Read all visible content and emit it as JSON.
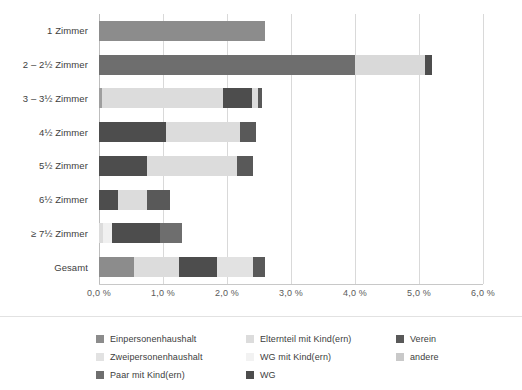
{
  "chart_data": {
    "type": "bar",
    "orientation": "horizontal",
    "stacked": true,
    "title": "",
    "subtitle": "",
    "xlabel": "",
    "ylabel": "",
    "xlim": [
      0.0,
      6.0
    ],
    "grid": true,
    "legend_position": "bottom",
    "xticks": [
      0.0,
      1.0,
      2.0,
      3.0,
      4.0,
      5.0,
      6.0
    ],
    "xtick_labels": [
      "0,0 %",
      "1,0 %",
      "2,0 %",
      "3,0 %",
      "4,0 %",
      "5,0 %",
      "6,0 %"
    ],
    "categories": [
      "1 Zimmer",
      "2 – 2½ Zimmer",
      "3 – 3½ Zimmer",
      "4½ Zimmer",
      "5½ Zimmer",
      "6½ Zimmer",
      "≥ 7½ Zimmer",
      "Gesamt"
    ],
    "series": [
      {
        "name": "Einpersonenhaushalt",
        "color": "#8c8c8c",
        "values": [
          2.6,
          0.0,
          0.0,
          0.0,
          0.0,
          0.0,
          0.0,
          0.55
        ]
      },
      {
        "name": "Zweipersonenhaushalt",
        "color": "#d5d5d5",
        "values": [
          0.0,
          0.0,
          0.0,
          0.0,
          0.0,
          0.0,
          0.07,
          0.7
        ]
      },
      {
        "name": "Paar mit Kind(ern)",
        "color": "#6e6e6e",
        "values": [
          0.0,
          4.0,
          0.0,
          0.0,
          0.0,
          0.0,
          0.0,
          0.0
        ]
      },
      {
        "name": "Elternteil mit Kind(ern)",
        "color": "#d9d9d9",
        "values": [
          0.0,
          1.1,
          0.05,
          0.0,
          0.0,
          0.0,
          0.0,
          0.0
        ]
      },
      {
        "name": "WG mit Kind(ern)",
        "color": "#ededed",
        "values": [
          0.0,
          0.0,
          1.88,
          0.0,
          0.0,
          0.0,
          0.0,
          0.0
        ]
      },
      {
        "name": "WG",
        "color": "#4d4d4d",
        "values": [
          0.0,
          0.1,
          0.46,
          1.05,
          0.75,
          0.3,
          0.75,
          0.6
        ]
      },
      {
        "name": "Verein",
        "color": "#595959",
        "values": [
          0.0,
          0.0,
          0.06,
          0.25,
          0.25,
          0.36,
          0.35,
          0.2
        ]
      },
      {
        "name": "andere",
        "color": "#c9c9c9",
        "values": [
          0.0,
          0.0,
          0.1,
          1.15,
          1.4,
          0.45,
          0.13,
          0.55
        ]
      }
    ],
    "bars": [
      {
        "category": "1 Zimmer",
        "total": 2.6,
        "segments": [
          {
            "series": "Einpersonenhaushalt",
            "start": 0.0,
            "value": 2.6,
            "color": "#8c8c8c"
          }
        ]
      },
      {
        "category": "2 – 2½ Zimmer",
        "total": 5.2,
        "segments": [
          {
            "series": "Paar mit Kind(ern)",
            "start": 0.0,
            "value": 4.0,
            "color": "#6e6e6e"
          },
          {
            "series": "Elternteil mit Kind(ern)",
            "start": 4.0,
            "value": 1.1,
            "color": "#d9d9d9"
          },
          {
            "series": "WG",
            "start": 5.1,
            "value": 0.1,
            "color": "#4d4d4d"
          }
        ]
      },
      {
        "category": "3 – 3½ Zimmer",
        "total": 2.55,
        "segments": [
          {
            "series": "Elternteil mit Kind(ern)",
            "start": 0.0,
            "value": 0.05,
            "color": "#9e9e9e"
          },
          {
            "series": "WG mit Kind(ern)",
            "start": 0.05,
            "value": 1.88,
            "color": "#dcdcdc"
          },
          {
            "series": "WG",
            "start": 1.93,
            "value": 0.46,
            "color": "#4d4d4d"
          },
          {
            "series": "andere",
            "start": 2.39,
            "value": 0.1,
            "color": "#dcdcdc"
          },
          {
            "series": "Verein",
            "start": 2.49,
            "value": 0.06,
            "color": "#595959"
          }
        ]
      },
      {
        "category": "4½ Zimmer",
        "total": 2.45,
        "segments": [
          {
            "series": "WG",
            "start": 0.0,
            "value": 1.05,
            "color": "#4d4d4d"
          },
          {
            "series": "andere",
            "start": 1.05,
            "value": 1.15,
            "color": "#dcdcdc"
          },
          {
            "series": "Verein",
            "start": 2.2,
            "value": 0.25,
            "color": "#595959"
          }
        ]
      },
      {
        "category": "5½ Zimmer",
        "total": 2.4,
        "segments": [
          {
            "series": "WG",
            "start": 0.0,
            "value": 0.75,
            "color": "#4d4d4d"
          },
          {
            "series": "andere",
            "start": 0.75,
            "value": 1.4,
            "color": "#dcdcdc"
          },
          {
            "series": "Verein",
            "start": 2.15,
            "value": 0.25,
            "color": "#595959"
          }
        ]
      },
      {
        "category": "6½ Zimmer",
        "total": 1.11,
        "segments": [
          {
            "series": "WG",
            "start": 0.0,
            "value": 0.3,
            "color": "#4d4d4d"
          },
          {
            "series": "andere",
            "start": 0.3,
            "value": 0.45,
            "color": "#dcdcdc"
          },
          {
            "series": "Verein",
            "start": 0.75,
            "value": 0.36,
            "color": "#595959"
          }
        ]
      },
      {
        "category": "≥ 7½ Zimmer",
        "total": 1.3,
        "segments": [
          {
            "series": "Zweipersonenhaushalt",
            "start": 0.0,
            "value": 0.07,
            "color": "#dcdcdc"
          },
          {
            "series": "andere",
            "start": 0.07,
            "value": 0.13,
            "color": "#f0f0f0"
          },
          {
            "series": "WG",
            "start": 0.2,
            "value": 0.75,
            "color": "#4d4d4d"
          },
          {
            "series": "Verein",
            "start": 0.95,
            "value": 0.35,
            "color": "#6e6e6e"
          }
        ]
      },
      {
        "category": "Gesamt",
        "total": 2.6,
        "segments": [
          {
            "series": "Einpersonenhaushalt",
            "start": 0.0,
            "value": 0.55,
            "color": "#8c8c8c"
          },
          {
            "series": "Zweipersonenhaushalt",
            "start": 0.55,
            "value": 0.7,
            "color": "#dcdcdc"
          },
          {
            "series": "WG",
            "start": 1.25,
            "value": 0.6,
            "color": "#4d4d4d"
          },
          {
            "series": "andere",
            "start": 1.85,
            "value": 0.55,
            "color": "#e2e2e2"
          },
          {
            "series": "Verein",
            "start": 2.4,
            "value": 0.2,
            "color": "#595959"
          }
        ]
      }
    ],
    "legend": {
      "columns": [
        [
          {
            "label": "Einpersonenhaushalt",
            "color": "#8c8c8c"
          },
          {
            "label": "Zweipersonenhaushalt",
            "color": "#e2e2e2"
          },
          {
            "label": "Paar mit Kind(ern)",
            "color": "#6e6e6e"
          }
        ],
        [
          {
            "label": "Elternteil mit Kind(ern)",
            "color": "#dcdcdc"
          },
          {
            "label": "WG mit Kind(ern)",
            "color": "#f2f2f2"
          },
          {
            "label": "WG",
            "color": "#4d4d4d"
          }
        ],
        [
          {
            "label": "Verein",
            "color": "#595959"
          },
          {
            "label": "andere",
            "color": "#c9c9c9"
          }
        ]
      ]
    }
  }
}
